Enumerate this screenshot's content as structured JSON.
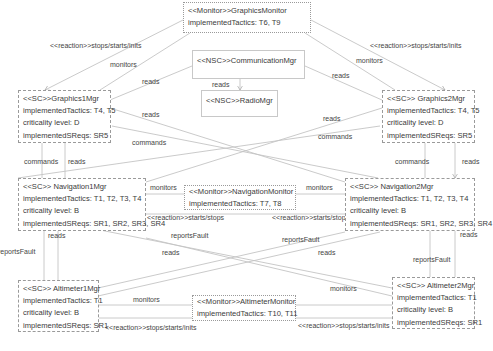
{
  "nodes": {
    "graphics_monitor": {
      "title": "<<Monitor>>GraphicsMonitor",
      "tactics": "implementedTactics: T6, T9"
    },
    "communication_mgr": {
      "title": "<<NSC>>CommunicationMgr"
    },
    "radio_mgr": {
      "title": "<<NSC>>RadioMgr"
    },
    "graphics1_mgr": {
      "title": "<<SC>>Graphics1Mgr",
      "tactics": "implementedTactics: T4, T5",
      "criticality": "criticality level: D",
      "sreqs": "implementedSReqs: SR5"
    },
    "graphics2_mgr": {
      "title": "<<SC>> Graphics2Mgr",
      "tactics": "implementedTactics: T4, T5",
      "criticality": "criticality level: D",
      "sreqs": "implementedSReqs: SR5"
    },
    "navigation1_mgr": {
      "title": "<<SC>> Navigation1Mgr",
      "tactics": "implementedTactics: T1, T2, T3, T4",
      "criticality": "criticality level: B",
      "sreqs": "implementedSReqs: SR1, SR2, SR3, SR4"
    },
    "navigation_monitor": {
      "title": "<<Monitor>>NavigationMonitor",
      "tactics": "implementedTactics: T7, T8"
    },
    "navigation2_mgr": {
      "title": "<<SC>> Navigation2Mgr",
      "tactics": "implementedTactics: T1, T2, T3, T4",
      "criticality": "criticality level: B",
      "sreqs": "implementedSReqs: SR1, SR2, SR3, SR4"
    },
    "altimeter1_mgr": {
      "title": "<<SC>> Altimeter1Mgr",
      "tactics": "implementedTactics: T1",
      "criticality": "criticality level: B",
      "sreqs": "implementedSReqs: SR1"
    },
    "altimeter_monitor": {
      "title": "<<Monitor>>AltimeterMonitor",
      "tactics": "implementedTactics: T10, T11"
    },
    "altimeter2_mgr": {
      "title": "<<SC>> Altimeter2Mgr",
      "tactics": "implementedTactics: T1",
      "criticality": "criticality level: B",
      "sreqs": "implementedSReqs: SR1"
    }
  },
  "edge_labels": {
    "reaction_inits": "<<reaction>>stops/starts/inits",
    "reaction_starts_stops": "<<reaction>>starts/stops",
    "monitors": "monitors",
    "reads": "reads",
    "commands": "commands",
    "reports_fault": "reportsFault"
  },
  "colors": {
    "line": "#bdbdbd",
    "border": "#9a9a9a",
    "text": "#3a3a3a"
  }
}
